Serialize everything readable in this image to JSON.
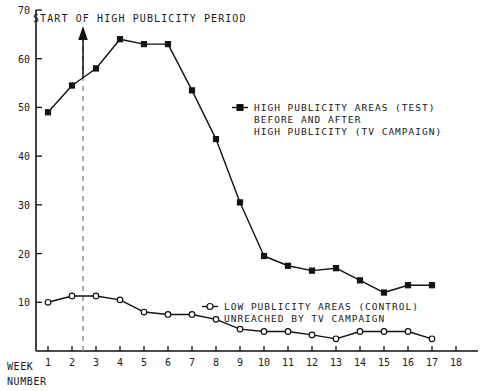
{
  "chart_data": {
    "type": "line",
    "title": "",
    "xlabel": "WEEK NUMBER",
    "ylabel": "",
    "xlim": [
      0,
      18.6
    ],
    "ylim": [
      0,
      70
    ],
    "grid": false,
    "legend_position": "inside-right",
    "x": [
      1,
      2,
      3,
      4,
      5,
      6,
      7,
      8,
      9,
      10,
      11,
      12,
      13,
      14,
      15,
      16,
      17
    ],
    "xtick_labels": [
      "1",
      "2",
      "3",
      "4",
      "5",
      "6",
      "7",
      "8",
      "9",
      "10",
      "11",
      "12",
      "13",
      "14",
      "15",
      "16",
      "17",
      "18"
    ],
    "xtick_values": [
      1,
      2,
      3,
      4,
      5,
      6,
      7,
      8,
      9,
      10,
      11,
      12,
      13,
      14,
      15,
      16,
      17,
      18
    ],
    "ytick_labels": [
      "10",
      "20",
      "30",
      "40",
      "50",
      "60",
      "70"
    ],
    "ytick_values": [
      10,
      20,
      30,
      40,
      50,
      60,
      70
    ],
    "series": [
      {
        "name": "HIGH PUBLICITY AREAS (TEST) BEFORE AND AFTER HIGH PUBLICITY (TV CAMPAIGN)",
        "marker": "filled-square",
        "values": [
          49,
          54.5,
          58,
          64,
          63,
          63,
          53.5,
          43.5,
          30.5,
          19.5,
          17.5,
          16.5,
          17,
          14.5,
          12,
          13.5,
          13.5
        ]
      },
      {
        "name": "LOW PUBLICITY AREAS (CONTROL) UNREACHED BY TV CAMPAIGN",
        "marker": "open-circle",
        "values": [
          10,
          11.3,
          11.3,
          10.5,
          8,
          7.5,
          7.5,
          6.5,
          4.5,
          4,
          4,
          3.3,
          2.5,
          4,
          4,
          4,
          2.5
        ]
      }
    ],
    "annotations": [
      {
        "text": "START OF HIGH PUBLICITY PERIOD",
        "x": 2.45,
        "type": "vertical-dashed-line-with-arrow"
      }
    ]
  },
  "axis": {
    "y_top_label": "70",
    "week_label_line1": "WEEK",
    "week_label_line2": "NUMBER"
  },
  "annotation": {
    "start_period_label": "START OF HIGH PUBLICITY PERIOD"
  },
  "legend": {
    "test": {
      "line1": "HIGH PUBLICITY AREAS (TEST)",
      "line2": "BEFORE AND AFTER",
      "line3": "HIGH PUBLICITY (TV CAMPAIGN)"
    },
    "control": {
      "line1": "LOW PUBLICITY AREAS (CONTROL)",
      "line2": "UNREACHED BY TV CAMPAIGN"
    }
  },
  "colors": {
    "ink": "#111111",
    "dashed_guide": "#9a9a9a",
    "background": "#ffffff"
  }
}
